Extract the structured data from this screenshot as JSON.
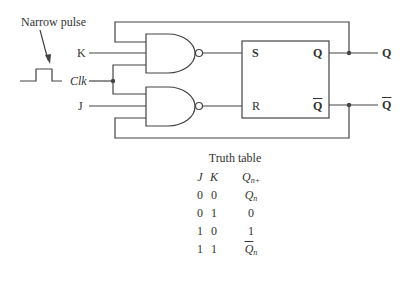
{
  "diagram": {
    "annotation": "Narrow pulse",
    "inputs": {
      "k": "K",
      "clk": "Clk",
      "j": "J"
    },
    "sr_box": {
      "s": "S",
      "r": "R",
      "q": "Q",
      "q_bar": "Q"
    },
    "outputs": {
      "q": "Q",
      "q_bar": "Q"
    },
    "colors": {
      "line": "#444444",
      "text": "#333333",
      "background": "#ffffff"
    }
  },
  "truth_table": {
    "title": "Truth table",
    "headers": {
      "j": "J",
      "k": "K",
      "q_base": "Q",
      "q_sub": "n+"
    },
    "rows": [
      {
        "j": "0",
        "k": "0",
        "q": "Q",
        "q_sub": "n",
        "overline": false
      },
      {
        "j": "0",
        "k": "1",
        "q": "0",
        "q_sub": "",
        "overline": false
      },
      {
        "j": "1",
        "k": "0",
        "q": "1",
        "q_sub": "",
        "overline": false
      },
      {
        "j": "1",
        "k": "1",
        "q": "Q",
        "q_sub": "n",
        "overline": true
      }
    ]
  }
}
